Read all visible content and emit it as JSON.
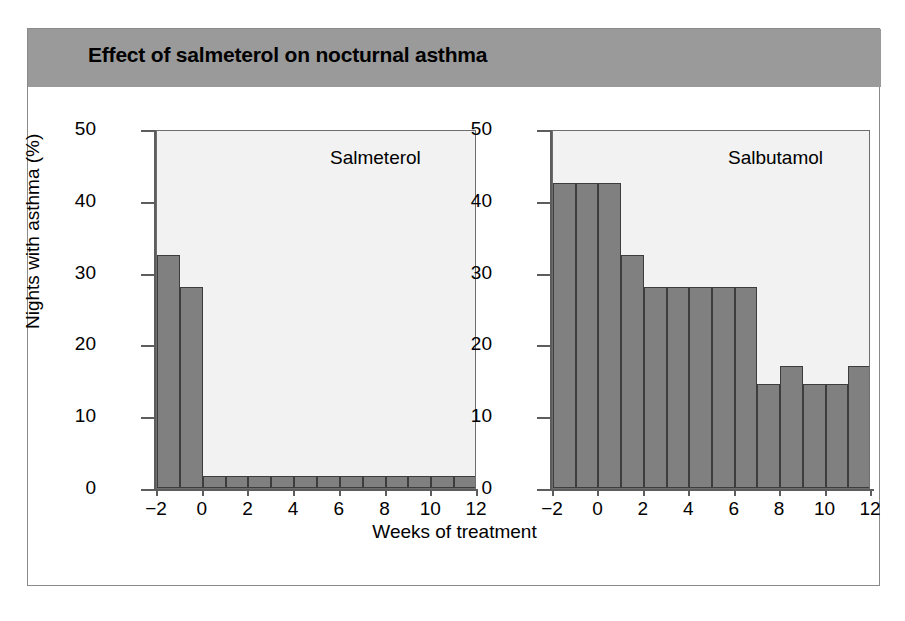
{
  "figure": {
    "title": "Effect of salmeterol on nocturnal asthma",
    "x_axis_title": "Weeks of treatment",
    "y_axis_title": "Nights with asthma (%)"
  },
  "chart_data": [
    {
      "type": "bar",
      "title": "Salmeterol",
      "panel_label": "Salmeterol",
      "xlabel": "Weeks of treatment",
      "ylabel": "Nights with asthma (%)",
      "ylim": [
        0,
        50
      ],
      "xlim": [
        -2,
        12
      ],
      "ytick_labels": [
        "0",
        "10",
        "20",
        "30",
        "40",
        "50"
      ],
      "yticks": [
        0,
        10,
        20,
        30,
        40,
        50
      ],
      "xtick_labels": [
        "-2",
        "0",
        "2",
        "4",
        "6",
        "8",
        "10",
        "12"
      ],
      "xticks": [
        -2,
        0,
        2,
        4,
        6,
        8,
        10,
        12
      ],
      "grid": false,
      "legend": "none",
      "categories": [
        -2,
        -1,
        0,
        1,
        2,
        3,
        4,
        5,
        6,
        7,
        8,
        9,
        10,
        11
      ],
      "values": [
        32.5,
        28,
        1.7,
        1.7,
        1.7,
        1.7,
        1.7,
        1.7,
        1.7,
        1.7,
        1.7,
        1.7,
        1.7,
        1.7
      ]
    },
    {
      "type": "bar",
      "title": "Salbutamol",
      "panel_label": "Salbutamol",
      "xlabel": "Weeks of treatment",
      "ylabel": "Nights with asthma (%)",
      "ylim": [
        0,
        50
      ],
      "xlim": [
        -2,
        12
      ],
      "ytick_labels": [
        "0",
        "10",
        "20",
        "30",
        "40",
        "50"
      ],
      "yticks": [
        0,
        10,
        20,
        30,
        40,
        50
      ],
      "xtick_labels": [
        "-2",
        "0",
        "2",
        "4",
        "6",
        "8",
        "10",
        "12"
      ],
      "xticks": [
        -2,
        0,
        2,
        4,
        6,
        8,
        10,
        12
      ],
      "grid": false,
      "legend": "none",
      "categories": [
        -2,
        -1,
        0,
        1,
        2,
        3,
        4,
        5,
        6,
        7,
        8,
        9,
        10,
        11
      ],
      "values": [
        42.5,
        42.5,
        42.5,
        32.5,
        28,
        28,
        28,
        28,
        28,
        14.5,
        17,
        14.5,
        14.5,
        17
      ]
    }
  ],
  "colors": {
    "title_bar": "#9a9a9a",
    "bar_fill": "#808080",
    "bar_edge": "#3d3d3d",
    "plot_background": "#f2f2f2",
    "axis": "#5d5d5d",
    "frame": "#8a8a8a"
  }
}
